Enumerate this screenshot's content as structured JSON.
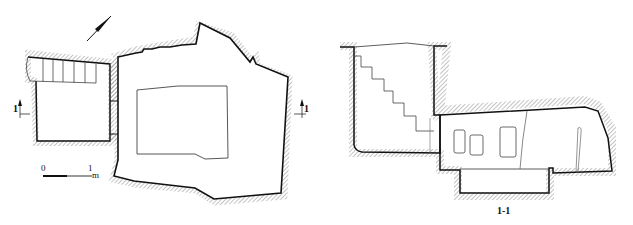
{
  "figure": {
    "type": "archaeological tomb plan and section drawing",
    "plan_view": {
      "north_arrow": "north-arrow-icon",
      "section_markers": {
        "left": "1",
        "right": "1"
      },
      "scale_bar": {
        "start": "0",
        "end": "1",
        "unit": "m"
      }
    },
    "section_view": {
      "label": "1-1"
    },
    "colors": {
      "line": "#111111",
      "hatch": "#888888",
      "background": "#ffffff"
    }
  }
}
